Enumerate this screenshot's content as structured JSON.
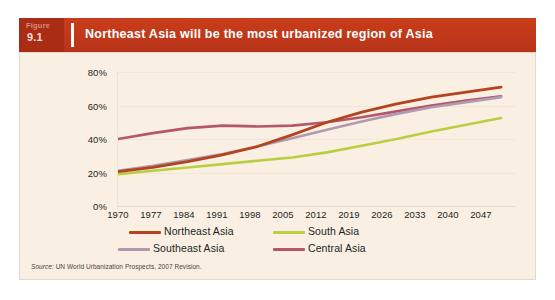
{
  "topstrip": {
    "text": "·   ·      ·        ·                ·              ·     ·· ·    ·"
  },
  "banner": {
    "figure_word": "Figure",
    "figure_number": "9.1",
    "title": "Northeast Asia will be the most urbanized region of Asia",
    "bg_color": "#c0381a",
    "fignum_bg_color": "#a82d14",
    "title_color": "#ffffff"
  },
  "panel": {
    "bg_color": "#f9f0e3",
    "border_color": "#e3d9c9"
  },
  "source": {
    "prefix": "Source:",
    "text": "UN World Urbanization Prospects, 2007 Revision."
  },
  "legend": {
    "items": [
      {
        "label": "Northeast Asia",
        "color": "#b4431f"
      },
      {
        "label": "South Asia",
        "color": "#b9cf3f"
      },
      {
        "label": "Southeast Asia",
        "color": "#b09ab0"
      },
      {
        "label": "Central Asia",
        "color": "#b5566b"
      }
    ]
  },
  "chart_data": {
    "type": "line",
    "title": "Northeast Asia will be the most urbanized region of Asia",
    "subtitle": "",
    "xlabel": "",
    "ylabel": "",
    "x": [
      1970,
      1977,
      1984,
      1991,
      1998,
      2005,
      2012,
      2019,
      2026,
      2033,
      2040,
      2047
    ],
    "xtick_labels": [
      "1970",
      "1977",
      "1984",
      "1991",
      "1998",
      "2005",
      "2012",
      "2019",
      "2026",
      "2033",
      "2040",
      "2047"
    ],
    "ytick_labels": [
      "0%",
      "20%",
      "40%",
      "60%",
      "80%"
    ],
    "ytick_values": [
      0,
      20,
      40,
      60,
      80
    ],
    "ylim": [
      0,
      85
    ],
    "xlim": [
      1970,
      2050
    ],
    "y_unit": "%",
    "grid": true,
    "grid_axis": "y",
    "legend_position": "below",
    "series": [
      {
        "name": "Northeast Asia",
        "color": "#b4431f",
        "values": [
          20.5,
          23.0,
          26.5,
          30.5,
          35.5,
          42.5,
          50.0,
          56.0,
          61.0,
          65.0,
          68.0,
          71.0
        ]
      },
      {
        "name": "South Asia",
        "color": "#b9cf3f",
        "values": [
          19.0,
          21.0,
          23.0,
          25.0,
          27.0,
          29.0,
          32.0,
          36.0,
          40.0,
          44.5,
          48.5,
          52.5
        ]
      },
      {
        "name": "Southeast Asia",
        "color": "#b09ab0",
        "values": [
          21.0,
          24.0,
          27.5,
          31.0,
          35.5,
          40.5,
          45.5,
          50.5,
          55.0,
          59.0,
          62.0,
          65.0
        ]
      },
      {
        "name": "Central Asia",
        "color": "#b5566b",
        "values": [
          40.0,
          43.5,
          46.5,
          48.0,
          47.5,
          48.0,
          50.0,
          53.0,
          56.5,
          60.0,
          63.0,
          65.5
        ]
      }
    ]
  }
}
